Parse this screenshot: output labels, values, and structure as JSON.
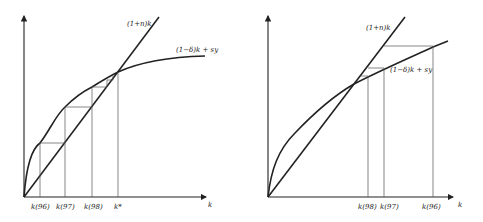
{
  "left_panel": {
    "line_label": "(1+n)k",
    "curve_label": "(1−δ)k + sy",
    "x_axis_label": "k",
    "ticks": [
      "k(96)",
      "k(97)",
      "k(98)",
      "k*"
    ]
  },
  "right_panel": {
    "line_label": "(1+n)k",
    "curve_label": "(1−δ)k + sy",
    "x_axis_label": "k",
    "ticks": [
      "k(98)",
      "k(97)",
      "k(96)"
    ]
  },
  "colors": {
    "curve": "#222222",
    "guide": "#555555",
    "background": "#ffffff"
  }
}
